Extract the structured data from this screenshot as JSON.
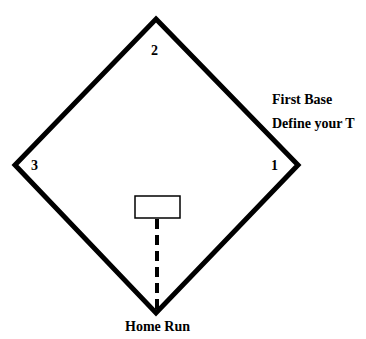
{
  "diagram": {
    "bases": {
      "first": "1",
      "second": "2",
      "third": "3"
    },
    "labels": {
      "first_base_title": "First Base",
      "first_base_subtitle": "Define your T",
      "home": "Home Run"
    },
    "colors": {
      "line": "#000000",
      "background": "#ffffff"
    }
  }
}
